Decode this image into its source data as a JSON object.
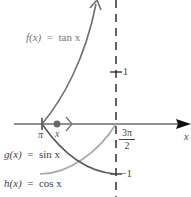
{
  "diagram": {
    "title": "",
    "functions": [
      {
        "id": "tan",
        "label": "f(x) = tan x",
        "fname": "f(x)",
        "expr": "tan x",
        "color": "#6e6e6e"
      },
      {
        "id": "sin",
        "label": "g(x) = sin x",
        "fname": "g(x)",
        "expr": "sin x",
        "color": "#a8a8a8"
      },
      {
        "id": "cos",
        "label": "h(x) = cos x",
        "fname": "h(x)",
        "expr": "cos x",
        "color": "#5a5a5a"
      }
    ],
    "axis": {
      "x_label": "x",
      "ticks_x": [
        {
          "label": "π",
          "value": "pi"
        },
        {
          "label_num": "3π",
          "label_den": "2",
          "value": "3pi/2"
        }
      ],
      "ticks_y": [
        {
          "label": "1",
          "value": 1
        },
        {
          "label": "−1",
          "value": -1
        }
      ],
      "asymptote": "x = 3π/2"
    },
    "point": {
      "label": "x",
      "direction": ">"
    },
    "colors": {
      "axis": "#222222",
      "dash": "#222222",
      "point": "#666666"
    }
  }
}
